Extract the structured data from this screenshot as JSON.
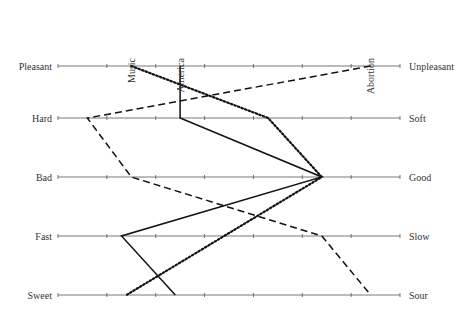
{
  "chart_data": {
    "type": "line",
    "title": "",
    "orientation": "horizontal-scales",
    "scale_points": 7,
    "xlim": [
      0,
      7
    ],
    "grid": false,
    "scales": [
      {
        "left": "Pleasant",
        "right": "Unpleasant"
      },
      {
        "left": "Hard",
        "right": "Soft"
      },
      {
        "left": "Bad",
        "right": "Good"
      },
      {
        "left": "Fast",
        "right": "Slow"
      },
      {
        "left": "Sweet",
        "right": "Sour"
      }
    ],
    "categories": [
      "Pleasant-Unpleasant",
      "Hard-Soft",
      "Bad-Good",
      "Fast-Slow",
      "Sweet-Sour"
    ],
    "series": [
      {
        "name": "Music",
        "style": "dotted",
        "values": [
          1.5,
          4.3,
          5.4,
          3.4,
          1.4
        ]
      },
      {
        "name": "America",
        "style": "solid",
        "values": [
          2.5,
          2.5,
          5.4,
          1.3,
          2.4
        ]
      },
      {
        "name": "Abortion",
        "style": "dashed",
        "values": [
          6.4,
          0.6,
          1.5,
          5.4,
          6.4
        ]
      }
    ],
    "legend": "series labels placed vertically above the top scale at each series' starting point"
  }
}
